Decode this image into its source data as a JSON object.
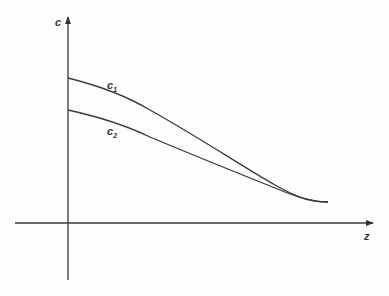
{
  "diagram": {
    "axes": {
      "y_label": "c",
      "x_label": "z"
    },
    "curves": [
      {
        "name": "c1",
        "label_base": "c",
        "label_sub": "1"
      },
      {
        "name": "c2",
        "label_base": "c",
        "label_sub": "2"
      }
    ],
    "colors": {
      "line": "#3a3a3a",
      "background": "#fdfdfd"
    }
  }
}
